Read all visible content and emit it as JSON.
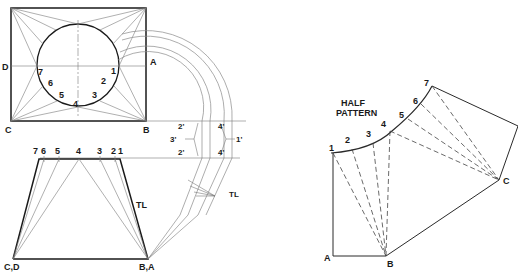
{
  "figure": {
    "plan_view": {
      "corner_labels": {
        "A": "A",
        "B": "B",
        "C": "C",
        "D": "D"
      },
      "circle_points": [
        "1",
        "2",
        "3",
        "4",
        "5",
        "6",
        "7"
      ]
    },
    "elbow_section": {
      "labels": {
        "p2a": "2'",
        "p2b": "2'",
        "p3": "3'",
        "p4a": "4'",
        "p4b": "4'",
        "p1": "1'"
      },
      "true_length_label": "TL"
    },
    "elevation_view": {
      "top_points": [
        "7",
        "6",
        "5",
        "4",
        "3",
        "2",
        "1"
      ],
      "bottom_left_label": "C,D",
      "bottom_right_label": "B,A",
      "true_length_label": "TL"
    },
    "half_pattern": {
      "title_line1": "HALF",
      "title_line2": "PATTERN",
      "arc_points": [
        "1",
        "2",
        "3",
        "4",
        "5",
        "6",
        "7"
      ],
      "corner_labels": {
        "A": "A",
        "B": "B",
        "C": "C"
      }
    }
  }
}
